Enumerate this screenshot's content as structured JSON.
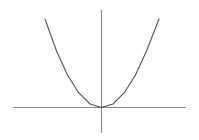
{
  "figure": {
    "title": "",
    "background_color": "#ffffff",
    "width": 199,
    "height": 140
  },
  "axes": {
    "x_axis": {
      "label": "",
      "color": "#888888",
      "stroke_width": 1.1,
      "y_pixel": 107.5,
      "x_start_pixel": 13,
      "x_end_pixel": 186
    },
    "y_axis": {
      "label": "",
      "color": "#888888",
      "stroke_width": 1.1,
      "x_pixel": 101.5,
      "y_start_pixel": 10,
      "y_end_pixel": 133
    },
    "origin_pixel": {
      "x": 101.5,
      "y": 107.5
    }
  },
  "curve": {
    "name": "parabola",
    "color": "#4f4f4f",
    "stroke_width": 1.1,
    "vertex_pixel": {
      "x": 101.5,
      "y": 107.5
    },
    "left_endpoint_pixel": {
      "x": 45,
      "y": 19
    },
    "right_endpoint_pixel": {
      "x": 159,
      "y": 19
    },
    "path": "M 45 19 Q 101.5 196 159 19"
  },
  "chart_data": {
    "type": "line",
    "title": "",
    "subtitle": "",
    "xlabel": "",
    "ylabel": "",
    "grid": false,
    "legend": null,
    "axis_style": "cartesian-cross",
    "series": [
      {
        "name": "y = a x^2",
        "equation": "y = 0.0275 x^2",
        "vertex": [
          0,
          0
        ],
        "opens": "upward",
        "x": [
          -56.5,
          -45,
          -34,
          -23,
          -11.5,
          0,
          11.5,
          23,
          34,
          45,
          57.5
        ],
        "y": [
          88.5,
          56.5,
          32.5,
          15,
          3.5,
          0,
          3.5,
          15,
          32.5,
          56.5,
          88.5
        ]
      }
    ],
    "xlim": [
      -88.5,
      84.5
    ],
    "ylim": [
      -25.5,
      97.5
    ]
  }
}
